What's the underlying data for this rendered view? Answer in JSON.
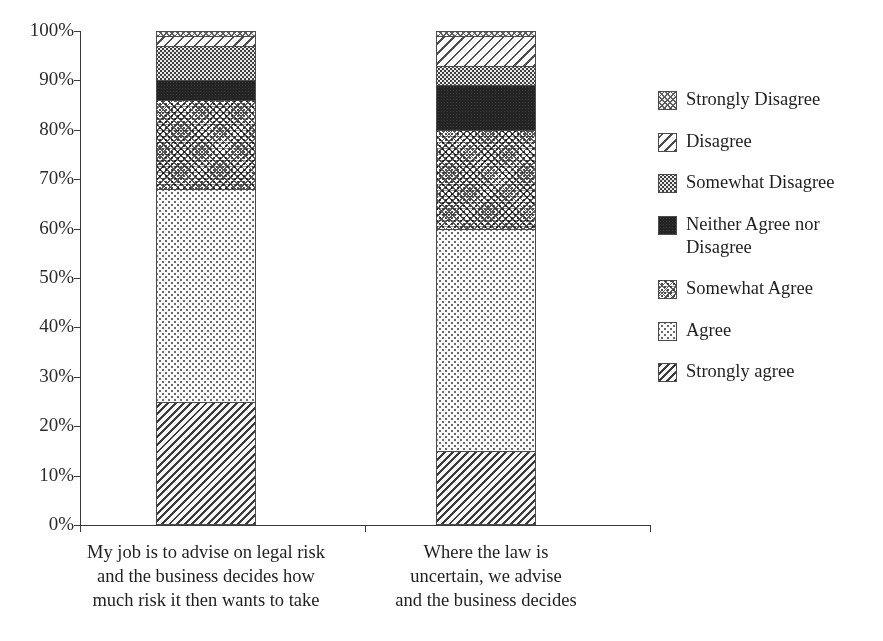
{
  "cropped_title_fragment": "",
  "chart_data": {
    "type": "bar",
    "stacked": true,
    "normalized_percent": true,
    "title": "",
    "xlabel": "",
    "ylabel": "",
    "ylim": [
      0,
      100
    ],
    "ytick_labels": [
      "100%",
      "90%",
      "80%",
      "70%",
      "60%",
      "50%",
      "40%",
      "30%",
      "20%",
      "10%",
      "0%"
    ],
    "ytick_values": [
      100,
      90,
      80,
      70,
      60,
      50,
      40,
      30,
      20,
      10,
      0
    ],
    "grid": false,
    "legend_position": "right",
    "categories": [
      "My job is to advise on legal risk and the business decides how much risk it then wants to take",
      "Where the law is uncertain, we advise and the business decides"
    ],
    "category_lines": [
      [
        "My job is to advise on legal risk",
        "and the business decides how",
        "much risk it then wants to take"
      ],
      [
        "Where the law is",
        "uncertain, we advise",
        "and the business decides"
      ]
    ],
    "series": [
      {
        "name": "Strongly agree",
        "pattern": "strongly-agree",
        "values": [
          25,
          15
        ]
      },
      {
        "name": "Agree",
        "pattern": "agree",
        "values": [
          43,
          45
        ]
      },
      {
        "name": "Somewhat Agree",
        "pattern": "somewhat-agree",
        "values": [
          18,
          20
        ]
      },
      {
        "name": "Neither Agree nor Disagree",
        "pattern": "neither",
        "values": [
          4,
          9
        ]
      },
      {
        "name": "Somewhat Disagree",
        "pattern": "somewhat-disagree",
        "values": [
          7,
          4
        ]
      },
      {
        "name": "Disagree",
        "pattern": "disagree",
        "values": [
          2,
          6
        ]
      },
      {
        "name": "Strongly Disagree",
        "pattern": "strongly-disagree",
        "values": [
          1,
          1
        ]
      }
    ],
    "legend_entries": [
      {
        "label": "Strongly Disagree",
        "pattern": "strongly-disagree"
      },
      {
        "label": "Disagree",
        "pattern": "disagree"
      },
      {
        "label": "Somewhat Disagree",
        "pattern": "somewhat-disagree"
      },
      {
        "label": "Neither Agree nor Disagree",
        "pattern": "neither"
      },
      {
        "label": "Somewhat Agree",
        "pattern": "somewhat-agree"
      },
      {
        "label": "Agree",
        "pattern": "agree"
      },
      {
        "label": "Strongly agree",
        "pattern": "strongly-agree"
      }
    ],
    "colors": {
      "ink": "#1f1f1f",
      "axis": "#3a3a3a",
      "neither_fill": "#242424",
      "background": "#ffffff"
    }
  }
}
